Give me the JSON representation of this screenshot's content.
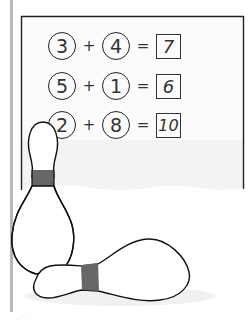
{
  "worksheet": {
    "equations": [
      {
        "a": "3",
        "plus": "+",
        "b": "4",
        "equals": "=",
        "answer": "7"
      },
      {
        "a": "5",
        "plus": "+",
        "b": "1",
        "equals": "=",
        "answer": "6"
      },
      {
        "a": "2",
        "plus": "+",
        "b": "8",
        "equals": "=",
        "answer": "10"
      }
    ]
  },
  "illustration": {
    "subject": "bowling-pins",
    "pin_stripe_color": "#666666",
    "outline_color": "#111111"
  }
}
